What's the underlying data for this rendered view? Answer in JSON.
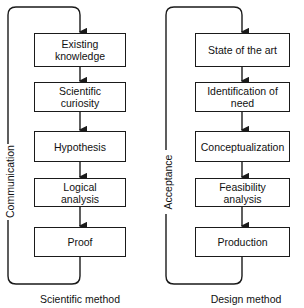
{
  "diagrams": [
    {
      "caption": "Scientific method",
      "loop_label": "Communication",
      "steps": [
        "Existing knowledge",
        "Scientific curiosity",
        "Hypothesis",
        "Logical analysis",
        "Proof"
      ]
    },
    {
      "caption": "Design method",
      "loop_label": "Acceptance",
      "steps": [
        "State of the art",
        "Identification of need",
        "Conceptualization",
        "Feasibility analysis",
        "Production"
      ]
    }
  ]
}
